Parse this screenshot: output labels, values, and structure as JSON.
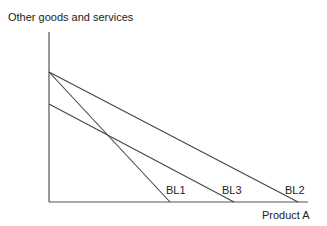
{
  "chart_data": {
    "type": "line",
    "title": "",
    "ylabel": "Other goods and services",
    "xlabel": "Product A",
    "grid": false,
    "lines": [
      {
        "name": "BL1",
        "from": [
          49,
          72
        ],
        "to": [
          170,
          202
        ]
      },
      {
        "name": "BL3",
        "from": [
          49,
          104
        ],
        "to": [
          234,
          202
        ]
      },
      {
        "name": "BL2",
        "from": [
          49,
          72
        ],
        "to": [
          298,
          202
        ]
      }
    ],
    "labels": [
      {
        "text": "BL1",
        "x": 166,
        "y": 194
      },
      {
        "text": "BL3",
        "x": 222,
        "y": 194
      },
      {
        "text": "BL2",
        "x": 285,
        "y": 194
      }
    ]
  },
  "axis": {
    "y_label": "Other goods and services",
    "x_label": "Product A"
  },
  "colors": {
    "line": "#444444",
    "axis": "#555555",
    "text": "#222222"
  }
}
